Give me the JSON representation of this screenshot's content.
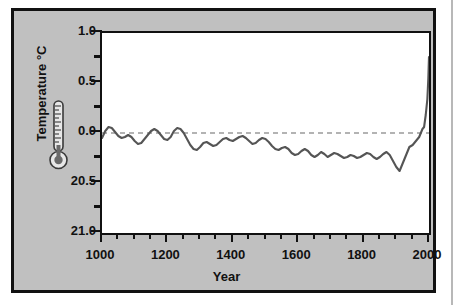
{
  "chart_data": {
    "type": "line",
    "title": "",
    "xlabel": "Year",
    "ylabel": "Temperature °C",
    "xlim": [
      1000,
      2000
    ],
    "ylim": [
      -1.0,
      1.0
    ],
    "grid": false,
    "legend": "none",
    "y_tick_labels": [
      "1.0",
      "0.5",
      "0.0",
      "20.5",
      "21.0"
    ],
    "y_tick_values": [
      1.0,
      0.5,
      0.0,
      -0.5,
      -1.0
    ],
    "y_minor_tick_values": [
      0.75,
      0.25,
      -0.25,
      -0.75
    ],
    "x_tick_labels": [
      "1000",
      "1200",
      "1400",
      "1600",
      "1800",
      "2000"
    ],
    "x_tick_values": [
      1000,
      1200,
      1400,
      1600,
      1800,
      2000
    ],
    "x_minor_tick_step": 50,
    "reference_line": {
      "value": 0.0,
      "style": "dashed",
      "color": "#9a9a9a"
    },
    "series": [
      {
        "name": "Reconstructed temperature anomaly",
        "color": "#555555",
        "x": [
          1000,
          1010,
          1020,
          1030,
          1040,
          1050,
          1060,
          1070,
          1080,
          1090,
          1100,
          1110,
          1120,
          1130,
          1140,
          1150,
          1160,
          1170,
          1180,
          1190,
          1200,
          1210,
          1220,
          1230,
          1240,
          1250,
          1260,
          1270,
          1280,
          1290,
          1300,
          1310,
          1320,
          1330,
          1340,
          1350,
          1360,
          1370,
          1380,
          1390,
          1400,
          1410,
          1420,
          1430,
          1440,
          1450,
          1460,
          1470,
          1480,
          1490,
          1500,
          1510,
          1520,
          1530,
          1540,
          1550,
          1560,
          1570,
          1580,
          1590,
          1600,
          1610,
          1620,
          1630,
          1640,
          1650,
          1660,
          1670,
          1680,
          1690,
          1700,
          1710,
          1720,
          1730,
          1740,
          1750,
          1760,
          1770,
          1780,
          1790,
          1800,
          1810,
          1820,
          1830,
          1840,
          1850,
          1860,
          1870,
          1880,
          1890,
          1900,
          1910,
          1920,
          1930,
          1940,
          1950,
          1960,
          1970,
          1980,
          1985,
          1990,
          1995,
          1998,
          2000
        ],
        "values": [
          -0.05,
          0.02,
          0.06,
          0.05,
          0.01,
          -0.03,
          -0.05,
          -0.04,
          -0.02,
          -0.04,
          -0.08,
          -0.11,
          -0.1,
          -0.06,
          -0.02,
          0.02,
          0.04,
          0.02,
          -0.02,
          -0.06,
          -0.07,
          -0.04,
          0.02,
          0.05,
          0.04,
          0.0,
          -0.06,
          -0.12,
          -0.16,
          -0.17,
          -0.14,
          -0.1,
          -0.09,
          -0.11,
          -0.13,
          -0.12,
          -0.09,
          -0.06,
          -0.05,
          -0.07,
          -0.08,
          -0.06,
          -0.04,
          -0.03,
          -0.05,
          -0.08,
          -0.11,
          -0.1,
          -0.07,
          -0.05,
          -0.06,
          -0.09,
          -0.13,
          -0.16,
          -0.17,
          -0.15,
          -0.14,
          -0.16,
          -0.2,
          -0.22,
          -0.21,
          -0.18,
          -0.16,
          -0.18,
          -0.22,
          -0.24,
          -0.22,
          -0.19,
          -0.21,
          -0.24,
          -0.22,
          -0.2,
          -0.21,
          -0.23,
          -0.25,
          -0.24,
          -0.22,
          -0.23,
          -0.25,
          -0.24,
          -0.22,
          -0.2,
          -0.21,
          -0.24,
          -0.26,
          -0.24,
          -0.21,
          -0.19,
          -0.22,
          -0.28,
          -0.34,
          -0.38,
          -0.3,
          -0.22,
          -0.14,
          -0.12,
          -0.08,
          -0.04,
          0.04,
          0.06,
          0.18,
          0.34,
          0.55,
          0.76
        ],
        "minimum": {
          "year": 1910,
          "value": -0.38
        },
        "maximum": {
          "year": 2000,
          "value": 0.76
        }
      }
    ]
  },
  "axes": {
    "y_title": "Temperature °C",
    "x_title": "Year"
  },
  "icons": {
    "thermometer": "thermometer-icon"
  },
  "colors": {
    "figure_background": "#c0c0c0",
    "plot_background": "#ffffff",
    "frame": "#111111",
    "line": "#555555",
    "zero_line": "#9a9a9a"
  }
}
